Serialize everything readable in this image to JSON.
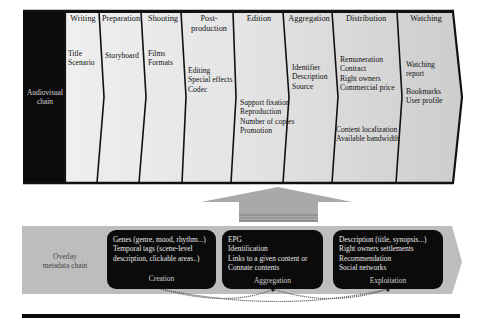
{
  "audiovisual_chain": {
    "label": "Audiovisual chain",
    "label_lines": [
      "Audiovisual",
      "chain"
    ],
    "stages": [
      {
        "title_lines": [
          "Writing"
        ],
        "items": [
          "Title",
          "Scenario"
        ]
      },
      {
        "title_lines": [
          "Preparation"
        ],
        "items": [
          "Storyboard"
        ]
      },
      {
        "title_lines": [
          "Shooting"
        ],
        "items": [
          "Films",
          "Formats"
        ]
      },
      {
        "title_lines": [
          "Post-",
          "production"
        ],
        "items": [
          "Editing",
          "Special effects",
          "Codec"
        ]
      },
      {
        "title_lines": [
          "Edition"
        ],
        "items": [
          "Support fixation",
          "Reproduction",
          "Number of copies",
          "Promotion"
        ]
      },
      {
        "title_lines": [
          "Aggregation"
        ],
        "items": [
          "Identifier",
          "Description",
          "Source"
        ]
      },
      {
        "title_lines": [
          "Distribution"
        ],
        "items_top": [
          "Remuneration",
          "Contract",
          "Right owners",
          "Commercial price"
        ],
        "items_bottom": [
          "Content localization",
          "Available bandwidth"
        ]
      },
      {
        "title_lines": [
          "Watching"
        ],
        "items_top": [
          "Watching",
          "report"
        ],
        "items_bottom": [
          "Bookmarks",
          "User profile"
        ]
      }
    ]
  },
  "overlay_metadata_chain": {
    "label_lines": [
      "Overlay",
      "metadata chain"
    ],
    "boxes": [
      {
        "lines": [
          "Genes (genre, mood, rhythm...)",
          "Temporal tags (scene-level",
          "description, clickable areas..)"
        ],
        "caption": "Creation"
      },
      {
        "lines": [
          "EPG",
          "Identification",
          "Links to a given content or",
          "Connate contents"
        ],
        "caption": "Aggregation"
      },
      {
        "lines": [
          "Description (title, synopsis...)",
          "Right owners settlements",
          "Recommendation",
          "Social networks"
        ],
        "caption": "Exploitation"
      }
    ]
  },
  "colors": {
    "black": "#0b0b0b",
    "stage_fill_light": "#ececec",
    "stage_fill_dark": "#cfcfcf",
    "overlay_band": "#bdbdbd",
    "up_arrow": "#a9a9a9"
  }
}
